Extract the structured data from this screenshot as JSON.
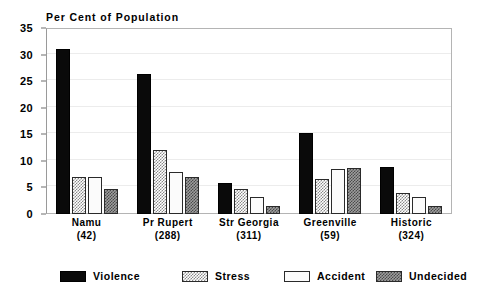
{
  "chart_data": {
    "type": "bar",
    "title": "Per Cent of Population",
    "xlabel": "",
    "ylabel": "",
    "ylim": [
      0,
      35
    ],
    "yticks": [
      0,
      5,
      10,
      15,
      20,
      25,
      30,
      35
    ],
    "ytick_labels": [
      "0",
      "5",
      "10",
      "15",
      "20",
      "25",
      "30",
      "35"
    ],
    "grid": true,
    "legend_position": "bottom",
    "categories": [
      "Namu",
      "Pr Rupert",
      "Str Georgia",
      "Greenville",
      "Historic"
    ],
    "category_counts": [
      "(42)",
      "(288)",
      "(311)",
      "(59)",
      "(324)"
    ],
    "category_labels": [
      "Namu (42)",
      "Pr Rupert (288)",
      "Str Georgia (311)",
      "Greenville (59)",
      "Historic (324)"
    ],
    "series": [
      {
        "name": "Violence",
        "key": "violence",
        "pattern": "solid-black",
        "color": "#0a0a0a",
        "values": [
          31.0,
          26.3,
          5.8,
          15.2,
          8.8
        ]
      },
      {
        "name": "Stress",
        "key": "stress",
        "pattern": "light-checker",
        "color": "#8a8a8a",
        "values": [
          7.0,
          12.0,
          4.7,
          6.6,
          4.0
        ]
      },
      {
        "name": "Accident",
        "key": "accident",
        "pattern": "solid-white",
        "color": "#fbfbfb",
        "values": [
          7.0,
          8.0,
          3.2,
          8.5,
          3.2
        ]
      },
      {
        "name": "Undecided",
        "key": "undecided",
        "pattern": "dark-checker",
        "color": "#4a4a4a",
        "values": [
          4.8,
          7.0,
          1.5,
          8.6,
          1.6
        ]
      }
    ]
  },
  "legend": {
    "items": [
      {
        "label": "Violence",
        "key": "violence"
      },
      {
        "label": "Stress",
        "key": "stress"
      },
      {
        "label": "Accident",
        "key": "accident"
      },
      {
        "label": "Undecided",
        "key": "undecided"
      }
    ]
  },
  "colors": {
    "violence": "#0a0a0a",
    "stress": "#8a8a8a",
    "accident": "#fbfbfb",
    "undecided": "#4a4a4a",
    "frame": "#b4b4b4",
    "grid": "#ececec",
    "text": "#000000",
    "background": "#ffffff"
  }
}
